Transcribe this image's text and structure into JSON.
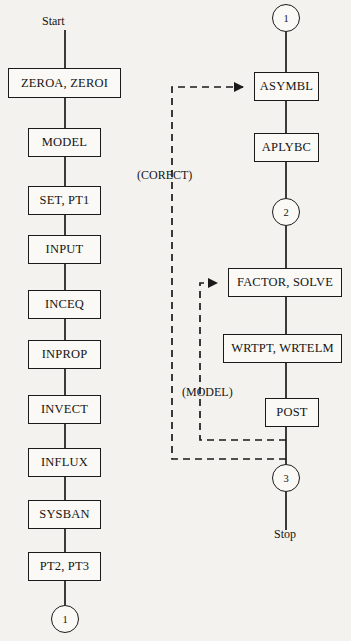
{
  "diagram": {
    "background_color": "#f4f2ee",
    "line_color": "#1a1a1a",
    "labels": {
      "start": "Start",
      "stop": "Stop"
    },
    "left_column": {
      "nodes": [
        {
          "id": "zeroa",
          "label": "ZEROA, ZEROI",
          "x": 8,
          "y": 68,
          "w": 113,
          "h": 30
        },
        {
          "id": "model",
          "label": "MODEL",
          "x": 28,
          "y": 128,
          "w": 73,
          "h": 29
        },
        {
          "id": "setpt1",
          "label": "SET, PT1",
          "x": 28,
          "y": 186,
          "w": 73,
          "h": 29
        },
        {
          "id": "input",
          "label": "INPUT",
          "x": 28,
          "y": 235,
          "w": 73,
          "h": 29
        },
        {
          "id": "inceq",
          "label": "INCEQ",
          "x": 28,
          "y": 290,
          "w": 73,
          "h": 29
        },
        {
          "id": "inprop",
          "label": "INPROP",
          "x": 28,
          "y": 340,
          "w": 73,
          "h": 29
        },
        {
          "id": "invect",
          "label": "INVECT",
          "x": 28,
          "y": 395,
          "w": 73,
          "h": 29
        },
        {
          "id": "influx",
          "label": "INFLUX",
          "x": 28,
          "y": 448,
          "w": 73,
          "h": 29
        },
        {
          "id": "sysban",
          "label": "SYSBAN",
          "x": 28,
          "y": 500,
          "w": 73,
          "h": 29
        },
        {
          "id": "pt2pt3",
          "label": "PT2, PT3",
          "x": 28,
          "y": 552,
          "w": 73,
          "h": 29
        }
      ],
      "connector_bottom": {
        "id": "conn-1-bottom",
        "label": "1",
        "cx": 65,
        "cy": 619,
        "r": 14
      },
      "start_label_x": 42,
      "start_label_y": 22
    },
    "right_column": {
      "connector_top": {
        "id": "conn-1-top",
        "label": "1",
        "cx": 286,
        "cy": 18,
        "r": 14
      },
      "nodes": [
        {
          "id": "asymbl",
          "label": "ASYMBL",
          "x": 254,
          "y": 72,
          "w": 65,
          "h": 29
        },
        {
          "id": "aplybc",
          "label": "APLYBC",
          "x": 254,
          "y": 133,
          "w": 65,
          "h": 29
        },
        {
          "id": "factor",
          "label": "FACTOR, SOLVE",
          "x": 228,
          "y": 268,
          "w": 114,
          "h": 29
        },
        {
          "id": "wrtpt",
          "label": "WRTPT, WRTELM",
          "x": 223,
          "y": 334,
          "w": 119,
          "h": 29
        },
        {
          "id": "post",
          "label": "POST",
          "x": 265,
          "y": 398,
          "w": 54,
          "h": 29
        }
      ],
      "connector_mid": {
        "id": "conn-2",
        "label": "2",
        "cx": 286,
        "cy": 212,
        "r": 14
      },
      "connector_bottom": {
        "id": "conn-3",
        "label": "3",
        "cx": 286,
        "cy": 478,
        "r": 14
      },
      "stop_label_x": 274,
      "stop_label_y": 527
    },
    "feedback_loops": [
      {
        "id": "corect-loop",
        "label": "(CORECT)",
        "label_x": 137,
        "label_y": 168,
        "target": "ASYMBL"
      },
      {
        "id": "model-loop",
        "label": "(MODEL)",
        "label_x": 182,
        "label_y": 385,
        "target": "FACTOR, SOLVE"
      }
    ]
  }
}
